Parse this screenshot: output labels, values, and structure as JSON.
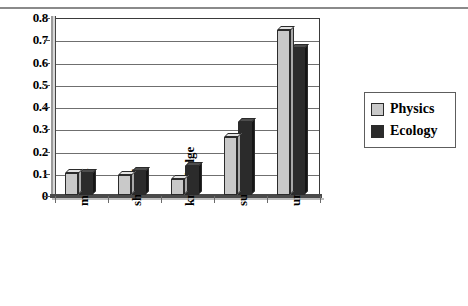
{
  "chart_data": {
    "type": "bar",
    "title": "",
    "xlabel": "",
    "ylabel": "",
    "ylim": [
      0,
      0.8
    ],
    "yticks": [
      "0",
      "0.1",
      "0.2",
      "0.3",
      "0.4",
      "0.5",
      "0.6",
      "0.7",
      "0.8"
    ],
    "ytick_values": [
      0,
      0.1,
      0.2,
      0.3,
      0.4,
      0.5,
      0.6,
      0.7,
      0.8
    ],
    "grid": true,
    "legend_position": "right",
    "categories": [
      "matrix",
      "shared",
      "knowledge",
      "sum",
      "unexplained"
    ],
    "series": [
      {
        "name": "Physics",
        "color": "#c9c9c9",
        "values": [
          0.1,
          0.09,
          0.07,
          0.26,
          0.74
        ]
      },
      {
        "name": "Ecology",
        "color": "#2b2b2b",
        "values": [
          0.1,
          0.11,
          0.13,
          0.33,
          0.66
        ]
      }
    ]
  },
  "legend": {
    "items": [
      {
        "label": "Physics",
        "swatch": "light"
      },
      {
        "label": "Ecology",
        "swatch": "dark"
      }
    ]
  },
  "header": {
    "title_fragment": ""
  }
}
